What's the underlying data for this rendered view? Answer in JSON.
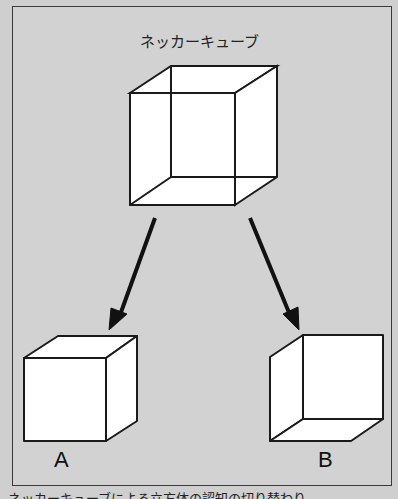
{
  "title": "ネッカーキューブ",
  "labels": {
    "a": "A",
    "b": "B"
  },
  "caption": "ネッカーキューブによる立方体の認知の切り替わり",
  "colors": {
    "background": "#cfcfcf",
    "stroke": "#1a1a1a",
    "face": "#ffffff"
  }
}
